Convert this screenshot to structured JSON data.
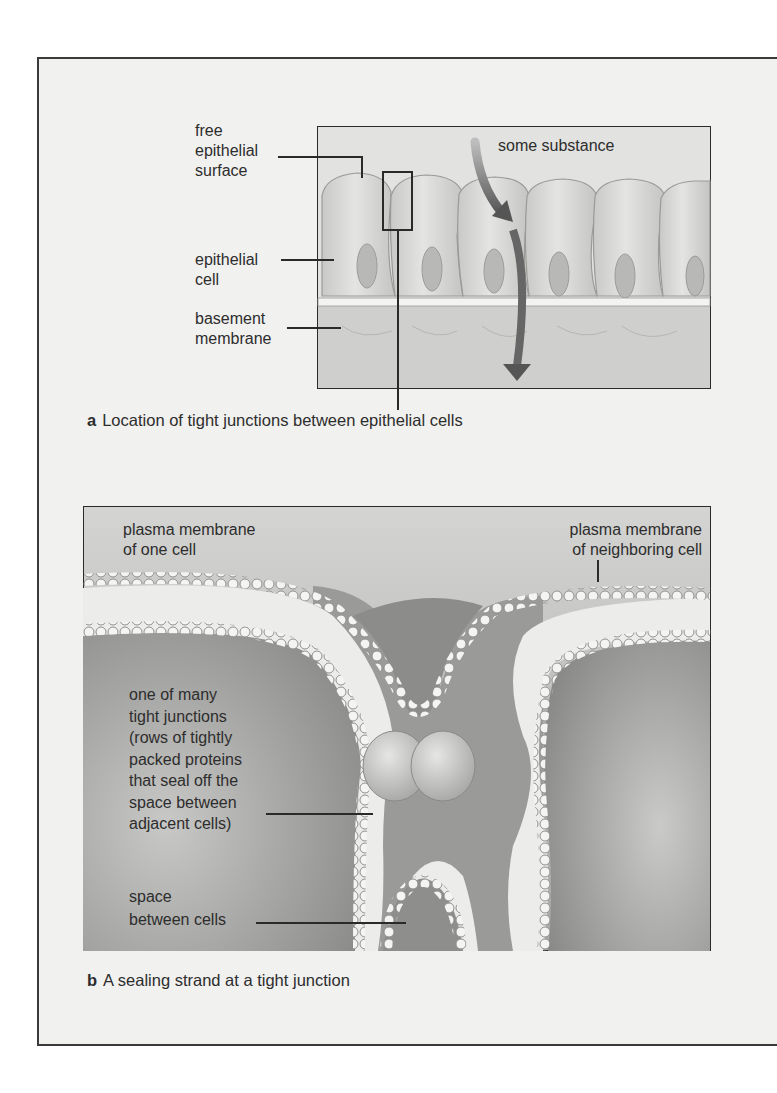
{
  "figure": {
    "panel_a": {
      "letter": "a",
      "caption": "Location of tight junctions between epithelial cells",
      "labels": {
        "free_surface": "free\nepithelial\nsurface",
        "epithelial_cell": "epithelial\ncell",
        "basement_membrane": "basement\nmembrane",
        "substance": "some substance"
      }
    },
    "panel_b": {
      "letter": "b",
      "caption": "A sealing strand at a tight junction",
      "labels": {
        "membrane_one": "plasma membrane\nof one cell",
        "membrane_neighbor": "plasma membrane\nof neighboring cell",
        "tight_junction": "one of many\ntight junctions\n(rows of tightly\npacked proteins\nthat seal off the\nspace between\nadjacent cells)",
        "space_between": "space\nbetween cells"
      }
    },
    "colors": {
      "background": "#f1f1f0",
      "outline": "#2a2a2a",
      "cell_fill": "#d9d9d7",
      "arrow": "#6a6a6a"
    }
  }
}
